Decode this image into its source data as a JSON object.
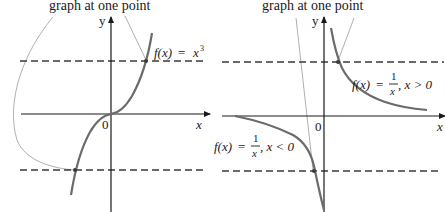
{
  "panels": [
    {
      "id": "cube",
      "caption": "graph at one point",
      "function_label": "f(x) = x³",
      "function_label_parts": {
        "fx": "f(x)",
        "eq": "=",
        "rhs": "x",
        "sup": "3"
      },
      "y_axis_label": "y",
      "x_axis_label": "x",
      "origin_label": "0"
    },
    {
      "id": "reciprocal",
      "caption": "graph at one point",
      "labels": [
        {
          "fx": "f(x)",
          "eq": "=",
          "num": "1",
          "den": "x",
          "cond": ", x > 0"
        },
        {
          "fx": "f(x)",
          "eq": "=",
          "num": "1",
          "den": "x",
          "cond": ", x < 0"
        }
      ],
      "y_axis_label": "y",
      "x_axis_label": "x",
      "origin_label": "0"
    }
  ],
  "colors": {
    "axis": "#1a1a1a",
    "curve": "#6b6b6b",
    "dashed": "#3a3a3a",
    "pointer": "#9a9a9a"
  }
}
